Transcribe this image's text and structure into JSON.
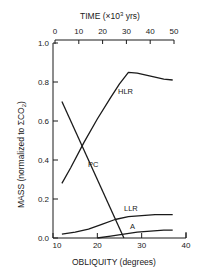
{
  "chart_data": {
    "type": "line",
    "title": "",
    "xlabel": "OBLIQUITY (degrees)",
    "ylabel": "MASS (normalized to ΣCO2)",
    "x2label": "TIME (×10³ yrs)",
    "xlim": [
      10,
      40
    ],
    "ylim": [
      0.0,
      1.0
    ],
    "x2lim": [
      0,
      50
    ],
    "xticks": [
      10,
      20,
      30,
      40
    ],
    "yticks": [
      0.0,
      0.2,
      0.4,
      0.6,
      0.8,
      1.0
    ],
    "x2ticks": [
      0,
      10,
      20,
      30,
      40,
      50
    ],
    "grid": false,
    "legend": "inline labels",
    "series": [
      {
        "name": "HLR",
        "x": [
          12,
          14,
          17,
          20,
          23,
          25,
          27,
          29,
          31,
          33,
          35,
          37
        ],
        "y": [
          0.28,
          0.36,
          0.49,
          0.61,
          0.72,
          0.79,
          0.85,
          0.845,
          0.835,
          0.825,
          0.815,
          0.81
        ]
      },
      {
        "name": "PC",
        "x": [
          12,
          26
        ],
        "y": [
          0.7,
          0.0
        ]
      },
      {
        "name": "LLR",
        "x": [
          12,
          15,
          18,
          21,
          24,
          27,
          30,
          33,
          37
        ],
        "y": [
          0.02,
          0.03,
          0.045,
          0.07,
          0.095,
          0.11,
          0.115,
          0.12,
          0.12
        ]
      },
      {
        "name": "A",
        "x": [
          20,
          23,
          26,
          29,
          32,
          35,
          37
        ],
        "y": [
          0.0,
          0.01,
          0.02,
          0.03,
          0.035,
          0.04,
          0.04
        ]
      }
    ]
  },
  "labels": {
    "top_axis_title": "TIME (×10",
    "top_axis_sup": "3",
    "top_axis_unit": " yrs)",
    "y_axis_title_main": "MASS (normalized to ΣCO",
    "y_axis_title_sub": "2",
    "y_axis_title_end": ")",
    "x_axis_title": "OBLIQUITY (degrees)",
    "y_ticks": [
      "0.0",
      "0.2",
      "0.4",
      "0.6",
      "0.8",
      "1.0"
    ],
    "x_ticks": [
      "10",
      "20",
      "30",
      "40"
    ],
    "top_ticks": [
      "0",
      "10",
      "20",
      "30",
      "40",
      "50"
    ],
    "series_names": [
      "HLR",
      "PC",
      "LLR",
      "A"
    ]
  }
}
